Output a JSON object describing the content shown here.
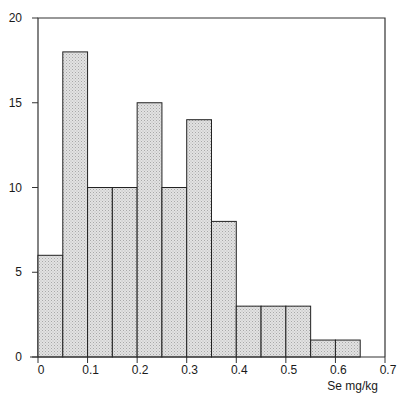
{
  "chart_data": {
    "type": "bar",
    "subtype": "histogram",
    "title": "",
    "xlabel": "Se mg/kg",
    "ylabel": "",
    "bin_width": 0.05,
    "bin_edges": [
      0,
      0.05,
      0.1,
      0.15,
      0.2,
      0.25,
      0.3,
      0.35,
      0.4,
      0.45,
      0.5,
      0.55,
      0.6,
      0.65
    ],
    "categories": [
      "0-0.05",
      "0.05-0.1",
      "0.1-0.15",
      "0.15-0.2",
      "0.2-0.25",
      "0.25-0.3",
      "0.3-0.35",
      "0.35-0.4",
      "0.4-0.45",
      "0.45-0.5",
      "0.5-0.55",
      "0.55-0.6",
      "0.6-0.65"
    ],
    "values": [
      6,
      18,
      10,
      10,
      15,
      10,
      14,
      8,
      3,
      3,
      3,
      1,
      1
    ],
    "xlim": [
      0,
      0.7
    ],
    "ylim": [
      0,
      20
    ],
    "xticks": [
      "0",
      "0.1",
      "0.2",
      "0.3",
      "0.4",
      "0.5",
      "0.6",
      "0.7"
    ],
    "yticks": [
      "0",
      "5",
      "10",
      "15",
      "20"
    ],
    "grid": false,
    "legend": null,
    "colors": {
      "bar_fill": "#d6d6d6",
      "bar_stroke": "#222222",
      "axis": "#333333"
    }
  }
}
